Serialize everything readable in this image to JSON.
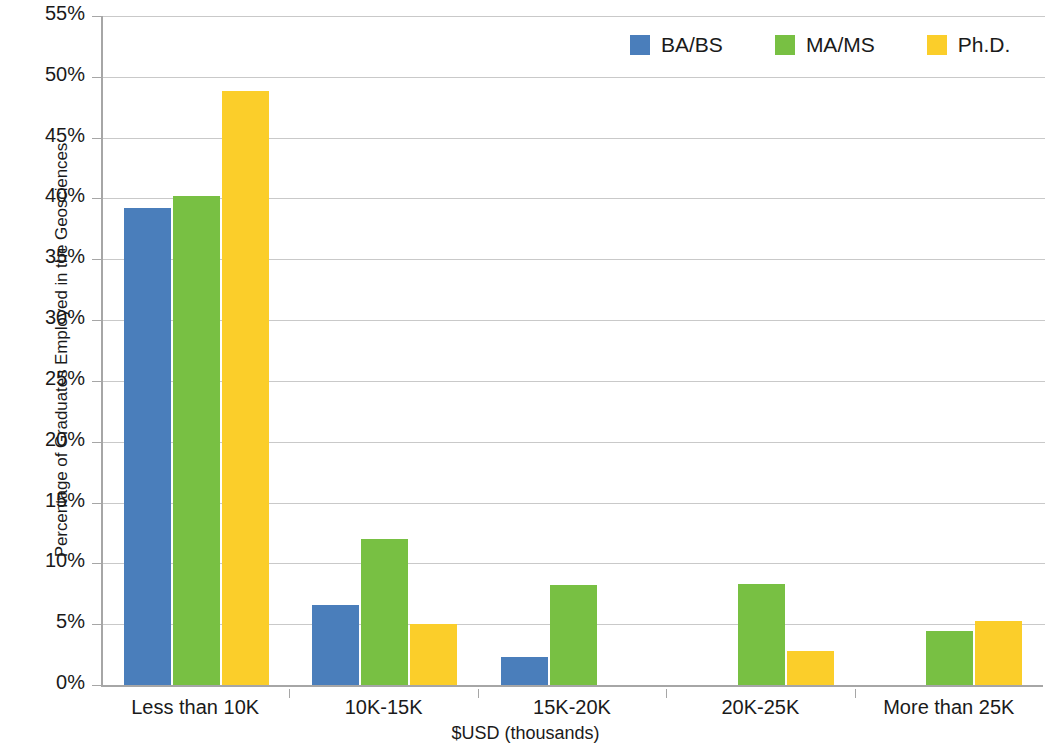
{
  "chart_data": {
    "type": "bar",
    "title": "",
    "xlabel": "$USD (thousands)",
    "ylabel": "Percentage of Graduates Employed in the Geosciences",
    "categories": [
      "Less than 10K",
      "10K-15K",
      "15K-20K",
      "20K-25K",
      "More than 25K"
    ],
    "series": [
      {
        "name": "BA/BS",
        "color": "#4A7EBB",
        "values": [
          39.2,
          6.6,
          2.3,
          null,
          null
        ]
      },
      {
        "name": "MA/MS",
        "color": "#78C043",
        "values": [
          40.2,
          12.0,
          8.2,
          8.3,
          4.4
        ]
      },
      {
        "name": "Ph.D.",
        "color": "#FBCE2A",
        "values": [
          48.8,
          5.0,
          null,
          2.8,
          5.3
        ]
      }
    ],
    "ylim": [
      0,
      55
    ],
    "ytick_step": 5,
    "ytick_labels": [
      "0%",
      "5%",
      "10%",
      "15%",
      "20%",
      "25%",
      "30%",
      "35%",
      "40%",
      "45%",
      "50%",
      "55%"
    ],
    "grid": true,
    "legend_position": "top-right",
    "bar_value_format": "percent"
  },
  "legend": {
    "entries": [
      {
        "label": "BA/BS",
        "color": "#4A7EBB"
      },
      {
        "label": "MA/MS",
        "color": "#78C043"
      },
      {
        "label": "Ph.D.",
        "color": "#FBCE2A"
      }
    ]
  },
  "axes": {
    "y_title": "Percentage of Graduates Employed in the Geosciences",
    "x_title": "$USD (thousands)"
  },
  "colors": {
    "gridline": "#c9c9c9",
    "axis": "#a6a6a6",
    "text": "#1a1a1a",
    "background": "#ffffff"
  }
}
